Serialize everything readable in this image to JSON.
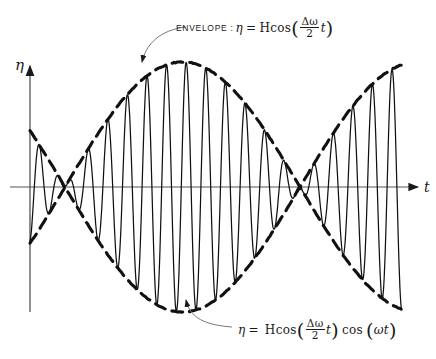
{
  "figure": {
    "kind": "beats-waveform-diagram",
    "ink_color": "#1a1a1a",
    "background": "#ffffff"
  },
  "axes": {
    "y_axis": {
      "label": "η",
      "name": "eta"
    },
    "x_axis": {
      "label": "t",
      "name": "time"
    }
  },
  "annotations": {
    "envelope": {
      "keyword": "ENVELOPE :",
      "lhs": "η",
      "equals": "=",
      "amplitude": "H",
      "func": "cos",
      "open": "(",
      "numerator": "Δω",
      "denominator": "2",
      "variable": "t",
      "close": ")"
    },
    "wave": {
      "lhs": "η",
      "equals": "=",
      "amplitude": "H",
      "func": "cos",
      "open": "(",
      "numerator": "Δω",
      "denominator": "2",
      "variable": "t",
      "close": ")",
      "func2": "cos",
      "open2": "(",
      "argument2": "ωt",
      "close2": ")"
    }
  },
  "chart_data": {
    "type": "line",
    "title": "",
    "xlabel": "t",
    "ylabel": "η",
    "grid": false,
    "legend": null,
    "geometry": {
      "origin_x": 30,
      "axis_y": 187,
      "x_start": 30,
      "x_end": 402,
      "t_arrow_end": 420,
      "y_axis_top": 62,
      "y_axis_bottom": 312,
      "amplitude_px": 125,
      "envelope_crest_y": 52,
      "envelope_trough_y": 310,
      "node_x": [
        65,
        300
      ],
      "beat_half_period_px": 235,
      "carrier_period_px": 19.6,
      "carrier_phase_deg": 0
    },
    "series": [
      {
        "name": "envelope-upper",
        "style": "dashed",
        "formula": "+H cos((dw/2) t)"
      },
      {
        "name": "envelope-lower",
        "style": "dashed",
        "formula": "-H cos((dw/2) t)"
      },
      {
        "name": "modulated-wave",
        "style": "solid",
        "formula": "H cos((dw/2) t) cos(wt)"
      }
    ]
  }
}
